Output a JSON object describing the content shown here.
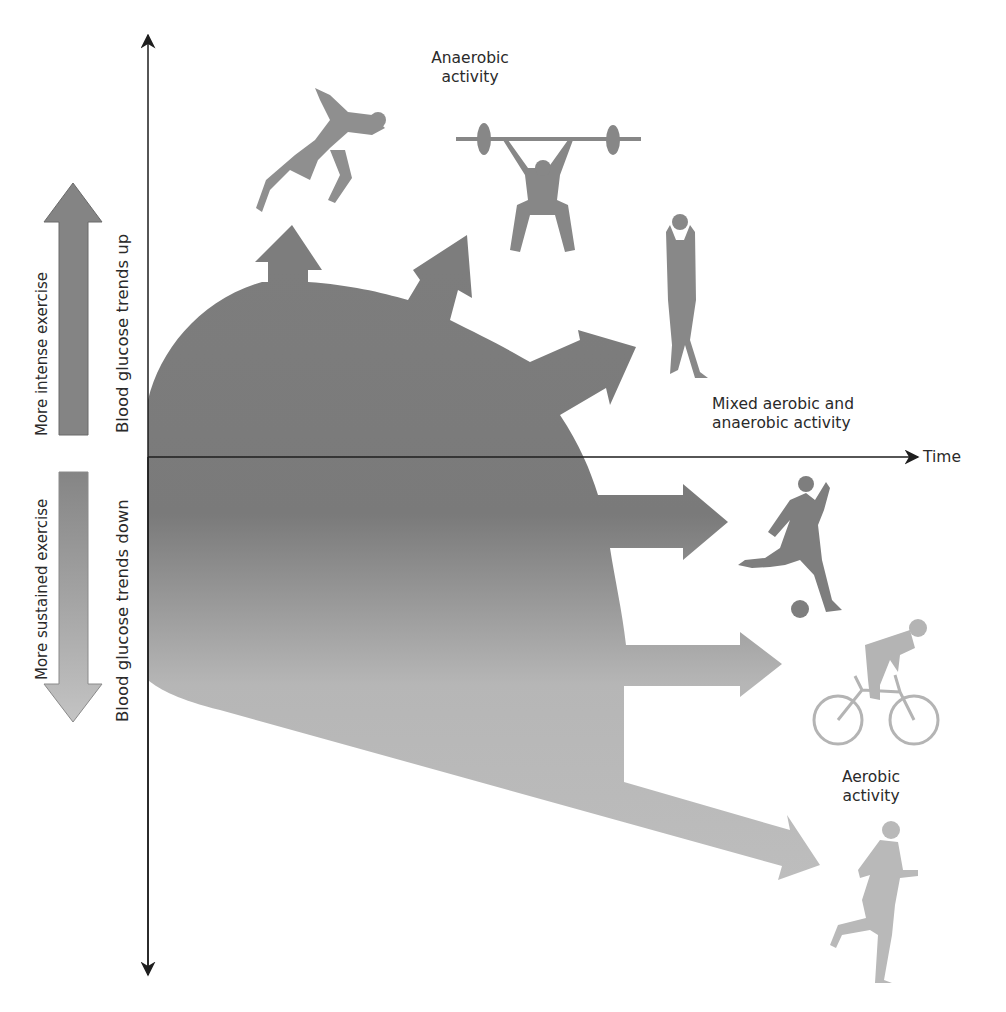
{
  "axes": {
    "x_label": "Time",
    "y_up_label": "Blood glucose trends up",
    "y_down_label": "Blood glucose trends down"
  },
  "side_arrows": {
    "up_label": "More intense exercise",
    "down_label": "More sustained exercise"
  },
  "categories": {
    "anaerobic": {
      "line1": "Anaerobic",
      "line2": "activity"
    },
    "mixed": {
      "line1": "Mixed aerobic and",
      "line2": "anaerobic activity"
    },
    "aerobic": {
      "line1": "Aerobic",
      "line2": "activity"
    }
  },
  "activities": [
    {
      "name": "sprinting",
      "category": "anaerobic"
    },
    {
      "name": "weightlifting",
      "category": "anaerobic"
    },
    {
      "name": "basketball",
      "category": "mixed"
    },
    {
      "name": "soccer",
      "category": "mixed"
    },
    {
      "name": "cycling",
      "category": "aerobic"
    },
    {
      "name": "running",
      "category": "aerobic"
    }
  ],
  "colors": {
    "dark_gray": "#7f7f7f",
    "mid_gray": "#8c8c8c",
    "light_gray": "#b8b8b8",
    "axis": "#1e1e1e",
    "text": "#2a2a2a"
  }
}
